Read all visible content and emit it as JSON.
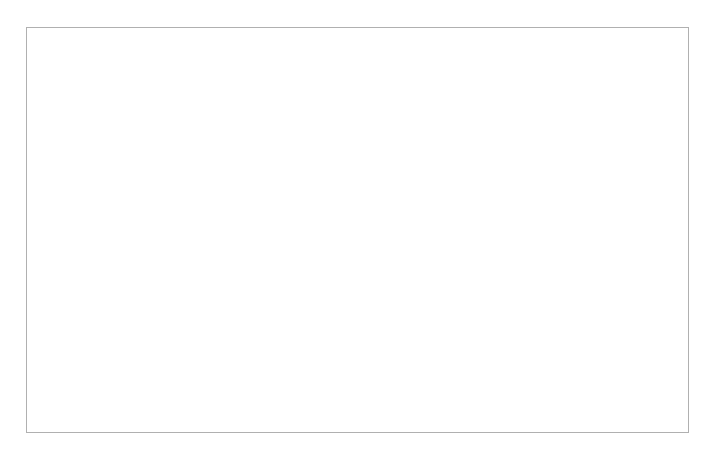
{
  "figure": {
    "background_color": "#ffffff",
    "frame_border_color": "#b0b0b0",
    "plot_background_color": "#e6f3e0"
  },
  "chart_data": {
    "type": "line",
    "title": "",
    "subtitle": "",
    "xlabel": "Wochen",
    "ylabel": "Kraft über der Ausgangskraft [%]",
    "xlim": [
      -47,
      74
    ],
    "ylim": [
      0,
      112
    ],
    "grid": false,
    "legend": "none",
    "x_tick_labels": [
      "40",
      "30",
      "20",
      "10",
      "0",
      "10",
      "20",
      "30",
      "40",
      "50",
      "60",
      "70"
    ],
    "x_tick_values": [
      -40,
      -30,
      -20,
      -10,
      0,
      10,
      20,
      30,
      40,
      50,
      60,
      70
    ],
    "y_tick_labels": [
      "0",
      "20",
      "40",
      "60",
      "80",
      "100"
    ],
    "y_tick_values": [
      0,
      20,
      40,
      60,
      80,
      100
    ],
    "axis_break_x": true,
    "zero_reference_line_x": 0,
    "series": [
      {
        "name": "blau-preoperativ",
        "color": "#3d82b7",
        "style": "dotted",
        "points": [
          [
            -45,
            0
          ],
          [
            -40,
            5
          ],
          [
            -30,
            24
          ],
          [
            -20,
            43
          ],
          [
            -13,
            55
          ],
          [
            -10,
            60
          ],
          [
            -5,
            68
          ],
          [
            -2,
            73
          ],
          [
            0,
            75
          ]
        ]
      },
      {
        "name": "blau-postoperativ",
        "color": "#3d82b7",
        "style": "dashed",
        "points": [
          [
            0,
            75
          ],
          [
            4,
            74
          ],
          [
            10,
            71
          ],
          [
            20,
            65
          ],
          [
            30,
            59
          ],
          [
            40,
            55
          ],
          [
            50,
            52
          ],
          [
            60,
            49
          ],
          [
            70,
            47
          ]
        ]
      },
      {
        "name": "gruen-solide-preoperativ",
        "color": "#1f6b45",
        "style": "solid",
        "points": [
          [
            -26,
            0
          ],
          [
            -24,
            9
          ],
          [
            -22,
            22
          ],
          [
            -20,
            33
          ],
          [
            -18,
            42
          ],
          [
            -16,
            51
          ],
          [
            -15,
            57
          ],
          [
            -14,
            62
          ],
          [
            -13,
            67
          ]
        ]
      },
      {
        "name": "gruen-punktiert-preoperativ",
        "color": "#1f6b45",
        "style": "dotted",
        "points": [
          [
            -27,
            0
          ],
          [
            -22,
            16
          ],
          [
            -18,
            32
          ],
          [
            -15,
            45
          ],
          [
            -13,
            53
          ],
          [
            -10,
            62
          ],
          [
            -7,
            69
          ],
          [
            -4,
            74
          ],
          [
            -2,
            77
          ],
          [
            0,
            79
          ]
        ]
      },
      {
        "name": "gruen-postoperativ",
        "color": "#1f6b45",
        "style": "dashed",
        "points": [
          [
            0,
            79
          ],
          [
            6,
            79
          ],
          [
            12,
            79
          ],
          [
            16,
            74
          ],
          [
            22,
            65
          ],
          [
            28,
            58
          ],
          [
            34,
            52
          ],
          [
            40,
            47
          ]
        ]
      },
      {
        "name": "rot-preoperativ",
        "color": "#e04a20",
        "style": "solid",
        "points": [
          [
            -21,
            0
          ],
          [
            -19,
            10
          ],
          [
            -17,
            21
          ],
          [
            -15,
            31
          ],
          [
            -13,
            40
          ],
          [
            -11,
            49
          ],
          [
            -9,
            59
          ],
          [
            -7,
            70
          ],
          [
            -5,
            81
          ],
          [
            -3,
            91
          ],
          [
            -1.5,
            98
          ]
        ]
      },
      {
        "name": "rot-postoperativ",
        "color": "#e04a20",
        "style": "dashed",
        "points": [
          [
            -1.5,
            98
          ],
          [
            1,
            80
          ],
          [
            3,
            62
          ],
          [
            6,
            48
          ],
          [
            12,
            35
          ],
          [
            20,
            20
          ],
          [
            27,
            8
          ],
          [
            31,
            0
          ]
        ]
      }
    ]
  }
}
